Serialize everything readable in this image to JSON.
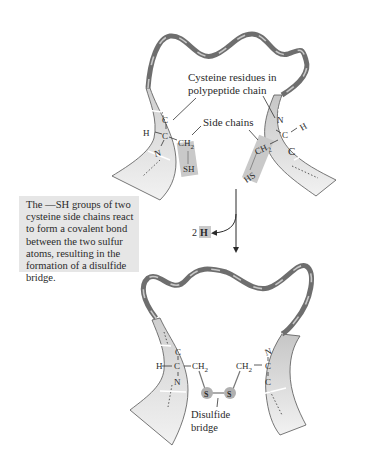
{
  "figure": {
    "top_panel": {
      "label_cysteine_line1": "Cysteine residues in",
      "label_cysteine_line2": "polypeptide chain",
      "label_side_chains": "Side chains",
      "left_residue": {
        "H": "H",
        "C_top": "C",
        "C_center": "C",
        "N": "N",
        "CH2": "CH",
        "CH2_sub": "2",
        "SH": "SH"
      },
      "right_residue": {
        "H": "H",
        "N": "N",
        "C_center": "C",
        "C_bottom": "C",
        "CH2": "CH",
        "CH2_sub": "2",
        "HS": "HS"
      }
    },
    "caption": "The —SH groups of two cysteine side chains react to form a covalent bond between the two sulfur atoms, resulting in the formation of a disulfide bridge.",
    "reaction": {
      "byproduct_count": "2",
      "byproduct_atom": "H"
    },
    "bottom_panel": {
      "left_residue": {
        "H": "H",
        "C_top": "C",
        "C_center": "C",
        "N": "N",
        "CH2": "CH",
        "CH2_sub": "2"
      },
      "right_residue": {
        "N": "N",
        "C_center": "C",
        "C_bottom": "C",
        "CH2": "CH",
        "CH2_sub": "2"
      },
      "sulfur_left": "S",
      "sulfur_right": "S",
      "label_disulfide_line1": "Disulfide",
      "label_disulfide_line2": "bridge"
    },
    "colors": {
      "ribbon_dark": "#6e6e6e",
      "ribbon_light": "#c8c8c8",
      "strand_fill": "#d4d4d4",
      "highlight_box": "#c9c9c9",
      "caption_bg": "#e6e6e6",
      "sulfur_fill": "#b0b0b0",
      "text": "#2a2a2a"
    }
  }
}
